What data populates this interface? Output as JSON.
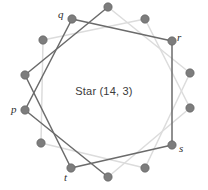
{
  "figure": {
    "caption": "Star (14, 3)",
    "width": 208,
    "height": 190,
    "background": "#ffffff"
  },
  "style": {
    "vertex_color": "#7d7d7d",
    "vertex_stroke": "#5d5d5d",
    "vertex_radius": 4.2,
    "edge_dark_color": "#6b6b6b",
    "edge_light_color": "#dcdcdc",
    "edge_width": 1.5,
    "caption_color": "#3a3a3a",
    "label_color": "#2e2e2e"
  },
  "labels": [
    {
      "id": "label-q",
      "text": "q",
      "x": 58,
      "y": 9,
      "vertex_index": 11
    },
    {
      "id": "label-r",
      "text": "r",
      "x": 177,
      "y": 32,
      "vertex_index": 2
    },
    {
      "id": "label-p",
      "text": "p",
      "x": 11,
      "y": 104,
      "vertex_index": 7
    },
    {
      "id": "label-s",
      "text": "s",
      "x": 179,
      "y": 143,
      "vertex_index": 5
    },
    {
      "id": "label-t",
      "text": "t",
      "x": 64,
      "y": 172,
      "vertex_index": 10
    }
  ],
  "chart_data": {
    "type": "diagram",
    "title": "Star (14, 3)",
    "n": 14,
    "step": 3,
    "circle": {
      "cx": 105,
      "cy": 93,
      "r": 86
    },
    "angle_offset_deg": -77.14,
    "vertices": [
      {
        "index": 0,
        "x": 124.1,
        "y": 9.0,
        "label": ""
      },
      {
        "index": 1,
        "x": 160.6,
        "y": 22.8,
        "label": ""
      },
      {
        "index": 2,
        "x": 182.9,
        "y": 54.5,
        "label": "r"
      },
      {
        "index": 3,
        "x": 185.4,
        "y": 93.2,
        "label": ""
      },
      {
        "index": 4,
        "x": 167.9,
        "y": 127.7,
        "label": ""
      },
      {
        "index": 5,
        "x": 135.6,
        "y": 149.0,
        "label": "s"
      },
      {
        "index": 6,
        "x": 97.0,
        "y": 152.8,
        "label": ""
      },
      {
        "index": 7,
        "x": 61.5,
        "y": 138.3,
        "label": "p"
      },
      {
        "index": 8,
        "x": 36.2,
        "y": 109.0,
        "label": ""
      },
      {
        "index": 9,
        "x": 26.9,
        "y": 71.5,
        "label": ""
      },
      {
        "index": 10,
        "x": 35.2,
        "y": 33.8,
        "label": "t"
      },
      {
        "index": 11,
        "x": 58.9,
        "y": 3.4,
        "label": "q"
      },
      {
        "index": 12,
        "x": 93.6,
        "y": -12.1,
        "label": ""
      },
      {
        "index": 13,
        "x": 131.6,
        "y": -7.8,
        "label": ""
      }
    ],
    "edges_description": "Each vertex i is connected to vertex (i+3) mod 14, producing a single closed 14-gram path; edges are rendered in two tones (dark gray and light gray) to show overlapping strands."
  },
  "geometry": {
    "nodes": [
      {
        "id": "n0",
        "x": 108,
        "y": 7,
        "label": ""
      },
      {
        "id": "n1",
        "x": 145,
        "y": 19,
        "label": ""
      },
      {
        "id": "n2",
        "x": 172,
        "y": 41,
        "label": "r"
      },
      {
        "id": "n3",
        "x": 190,
        "y": 73,
        "label": ""
      },
      {
        "id": "n4",
        "x": 190,
        "y": 108,
        "label": ""
      },
      {
        "id": "n5",
        "x": 172,
        "y": 145,
        "label": "s"
      },
      {
        "id": "n6",
        "x": 145,
        "y": 168,
        "label": ""
      },
      {
        "id": "n7",
        "x": 108,
        "y": 177,
        "label": ""
      },
      {
        "id": "n8",
        "x": 71,
        "y": 168,
        "label": "t"
      },
      {
        "id": "n9",
        "x": 41,
        "y": 143,
        "label": ""
      },
      {
        "id": "n10",
        "x": 25,
        "y": 110,
        "label": "p"
      },
      {
        "id": "n11",
        "x": 25,
        "y": 75,
        "label": ""
      },
      {
        "id": "n12",
        "x": 43,
        "y": 40,
        "label": ""
      },
      {
        "id": "n13",
        "x": 72,
        "y": 19,
        "label": "q"
      }
    ],
    "edges": [
      {
        "from": 0,
        "to": 3,
        "tone": "light"
      },
      {
        "from": 3,
        "to": 6,
        "tone": "light"
      },
      {
        "from": 6,
        "to": 9,
        "tone": "light"
      },
      {
        "from": 9,
        "to": 12,
        "tone": "light"
      },
      {
        "from": 12,
        "to": 1,
        "tone": "light"
      },
      {
        "from": 1,
        "to": 4,
        "tone": "light"
      },
      {
        "from": 4,
        "to": 7,
        "tone": "light"
      },
      {
        "from": 7,
        "to": 10,
        "tone": "dark"
      },
      {
        "from": 10,
        "to": 13,
        "tone": "dark"
      },
      {
        "from": 13,
        "to": 2,
        "tone": "dark"
      },
      {
        "from": 2,
        "to": 5,
        "tone": "dark"
      },
      {
        "from": 5,
        "to": 8,
        "tone": "dark"
      },
      {
        "from": 8,
        "to": 11,
        "tone": "dark"
      },
      {
        "from": 11,
        "to": 0,
        "tone": "dark"
      }
    ]
  }
}
